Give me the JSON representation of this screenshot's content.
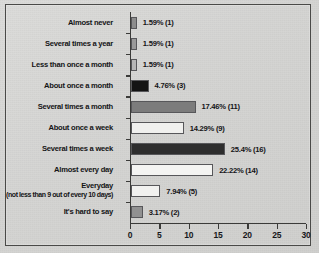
{
  "chart_data": {
    "type": "bar",
    "orientation": "horizontal",
    "title": "",
    "xlabel": "",
    "ylabel": "",
    "xlim": [
      0,
      30
    ],
    "xticks": [
      0,
      5,
      10,
      15,
      20,
      25,
      30
    ],
    "grid": false,
    "legend": "none",
    "categories": [
      "Almost never",
      "Several times a year",
      "Less than once a month",
      "About once a month",
      "Several times a month",
      "About once a week",
      "Several times a week",
      "Almost every day",
      "Everyday",
      "It's hard to say"
    ],
    "category_sublabels": [
      "",
      "",
      "",
      "",
      "",
      "",
      "",
      "",
      "(not less than 9 out of every 10 days)",
      ""
    ],
    "values": [
      1,
      1,
      1,
      3,
      11,
      9,
      16,
      14,
      5,
      2
    ],
    "percents": [
      1.59,
      1.59,
      1.59,
      4.76,
      17.46,
      14.29,
      25.4,
      22.22,
      7.94,
      3.17
    ],
    "data_labels": [
      "1.59% (1)",
      "1.59% (1)",
      "1.59% (1)",
      "4.76% (3)",
      "17.46% (11)",
      "14.29% (9)",
      "25.4% (16)",
      "22.22% (14)",
      "7.94% (5)",
      "3.17% (2)"
    ],
    "bar_colors": [
      "#8d8d8d",
      "#9a9a9a",
      "#b6b6b6",
      "#141414",
      "#7c7c7c",
      "#f0f0ee",
      "#2e2e2e",
      "#f4f4f2",
      "#f1f1ef",
      "#919191"
    ]
  },
  "axis": {
    "tick_labels": [
      "0",
      "5",
      "10",
      "15",
      "20",
      "25",
      "30"
    ]
  }
}
